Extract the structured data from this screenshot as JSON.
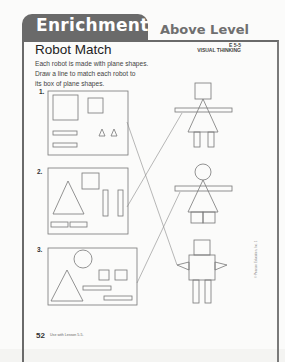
{
  "header": {
    "tab_title": "Enrichment",
    "level": "Above Level",
    "code": "E 5-5",
    "category": "VISUAL THINKING"
  },
  "activity": {
    "title": "Robot Match",
    "instructions": [
      "Each robot is made with plane shapes.",
      "Draw a line to match each robot to",
      "its box of plane shapes."
    ]
  },
  "boxes": [
    {
      "label": "1.",
      "shapes": [
        "large square",
        "small square",
        "2 rectangles",
        "2 triangles"
      ]
    },
    {
      "label": "2.",
      "shapes": [
        "large triangle",
        "small square",
        "2 vertical rectangles",
        "2 horizontal rectangles"
      ]
    },
    {
      "label": "3.",
      "shapes": [
        "circle",
        "large triangle",
        "2 small squares",
        "2 rectangles"
      ]
    }
  ],
  "robots": [
    {
      "name": "robot-square-head-dress",
      "matched_box": "2."
    },
    {
      "name": "robot-circle-head-dress",
      "matched_box": "3."
    },
    {
      "name": "robot-square-body-triangle-arms",
      "matched_box": "1."
    }
  ],
  "footer": {
    "page_number": "52",
    "lesson": "Use with Lesson 5-5.",
    "copyright": "© Pearson Education, Inc. 1"
  },
  "colors": {
    "tab": "#6a6a6a",
    "frame": "#6a6a6a",
    "line": "#777777"
  }
}
